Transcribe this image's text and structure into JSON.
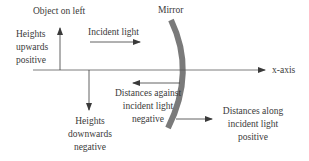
{
  "diagram": {
    "labels": {
      "object": "Object on left",
      "mirror": "Mirror",
      "heights_up": [
        "Heights",
        "upwards",
        "positive"
      ],
      "incident": "Incident light",
      "x_axis": "x-axis",
      "against": [
        "Distances against",
        "incident light",
        "negative"
      ],
      "heights_down": [
        "Heights",
        "downwards",
        "negative"
      ],
      "along": [
        "Distances along",
        "incident light",
        "positive"
      ]
    },
    "colors": {
      "line": "#3a3a3a",
      "mirror": "#7a7a7a",
      "text": "#3a3a3a"
    }
  }
}
